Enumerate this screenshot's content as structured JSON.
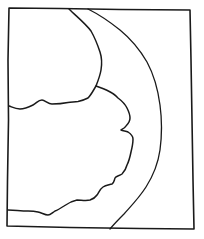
{
  "sketch": {
    "description": "Hand-drawn line sketch: rectangular frame containing two irregular lobed regions on the left and a curved band sweeping down the right side",
    "ink_color": "#1a1a1a",
    "paper_color": "#ffffff",
    "elements": [
      {
        "name": "frame",
        "kind": "rectangle-outline"
      },
      {
        "name": "upper-left-region-boundary",
        "kind": "irregular-line"
      },
      {
        "name": "lower-left-region-boundary",
        "kind": "irregular-line"
      },
      {
        "name": "curved-band-outer-line",
        "kind": "arc-line"
      }
    ]
  }
}
